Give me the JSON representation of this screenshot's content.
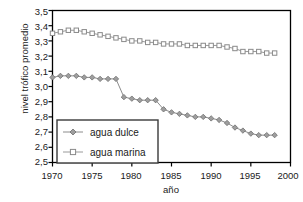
{
  "chart_data": {
    "type": "line",
    "title": "",
    "xlabel": "año",
    "ylabel": "nivel trófico promedio",
    "xlim": [
      1970,
      2000
    ],
    "ylim": [
      2.5,
      3.5
    ],
    "xticks": [
      "1970",
      "1975",
      "1980",
      "1985",
      "1990",
      "1995",
      "2000"
    ],
    "yticks": [
      "3,5",
      "3,4",
      "3,3",
      "3,2",
      "3,1",
      "3,0",
      "2,9",
      "2,8",
      "2,7",
      "2,6",
      "2,5"
    ],
    "grid": false,
    "legend_position": "lower-left",
    "decimal_separator": ",",
    "x": [
      1970,
      1971,
      1972,
      1973,
      1974,
      1975,
      1976,
      1977,
      1978,
      1979,
      1980,
      1981,
      1982,
      1983,
      1984,
      1985,
      1986,
      1987,
      1988,
      1989,
      1990,
      1991,
      1992,
      1993,
      1994,
      1995,
      1996,
      1997,
      1998
    ],
    "series": [
      {
        "name": "agua dulce",
        "marker": "diamond",
        "color": "#8c8c8c",
        "values": [
          3.06,
          3.07,
          3.07,
          3.07,
          3.06,
          3.06,
          3.05,
          3.05,
          3.05,
          2.93,
          2.92,
          2.91,
          2.91,
          2.91,
          2.85,
          2.83,
          2.82,
          2.81,
          2.8,
          2.8,
          2.79,
          2.78,
          2.76,
          2.73,
          2.71,
          2.69,
          2.68,
          2.68,
          2.68
        ]
      },
      {
        "name": "agua marina",
        "marker": "square",
        "color": "#9a9a9a",
        "values": [
          3.35,
          3.36,
          3.37,
          3.37,
          3.36,
          3.35,
          3.34,
          3.33,
          3.32,
          3.31,
          3.3,
          3.3,
          3.29,
          3.29,
          3.28,
          3.28,
          3.28,
          3.27,
          3.27,
          3.27,
          3.27,
          3.27,
          3.26,
          3.25,
          3.23,
          3.23,
          3.23,
          3.22,
          3.22
        ]
      }
    ]
  },
  "legend": {
    "items": [
      {
        "label": "agua dulce"
      },
      {
        "label": "agua marina"
      }
    ]
  },
  "axis": {
    "frame_color": "#000000"
  }
}
